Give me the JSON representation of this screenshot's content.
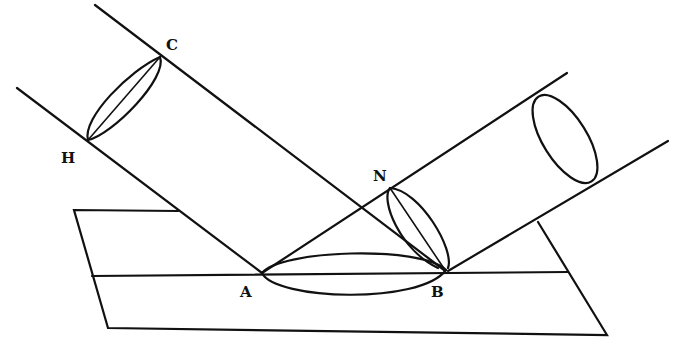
{
  "diagram": {
    "type": "reflection-of-light-beam-cylinder",
    "labels": {
      "A": "A",
      "B": "B",
      "C": "C",
      "H": "H",
      "N": "N"
    }
  }
}
